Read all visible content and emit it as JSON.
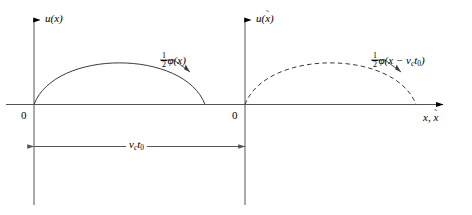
{
  "figure": {
    "type": "diagram",
    "background_color": "#ffffff",
    "line_color": "#000000",
    "panels": [
      {
        "id": "left-panel",
        "y_axis_label": "u(x)",
        "origin_label": "0",
        "curve_label_parts": {
          "numerator": "1",
          "denominator": "2",
          "phi": "φ",
          "argument": "(x)"
        },
        "curve_style": "solid",
        "curve_shape": "half-sine-arch",
        "curve_start_x": 0,
        "curve_end_x": 171,
        "curve_peak_height": 56
      },
      {
        "id": "right-panel",
        "y_axis_label_base": "u(",
        "y_axis_label_var": "x",
        "y_axis_label_accent": "˜",
        "y_axis_label_close": ")",
        "origin_label": "0",
        "x_axis_label_first": "x",
        "x_axis_label_sep": ",",
        "x_axis_label_second": "x",
        "x_axis_label_second_accent": "˜",
        "curve_label_parts": {
          "numerator": "1",
          "denominator": "2",
          "phi": "φ",
          "arg_open": "(x − ",
          "arg_v": "v",
          "arg_v_sub": "c",
          "arg_t": "t",
          "arg_t_sub": "0",
          "arg_close": ")"
        },
        "curve_style": "dashed",
        "curve_shape": "half-sine-arch",
        "curve_start_x": 0,
        "curve_end_x": 171,
        "curve_peak_height": 56
      }
    ],
    "dimension": {
      "label_v": "v",
      "label_v_sub": "c",
      "label_t": "t",
      "label_t_sub": "0",
      "arrow_style": "double-headed",
      "from": "left-origin",
      "to": "right-origin",
      "value_meaning": "translation distance of the pulse"
    }
  }
}
